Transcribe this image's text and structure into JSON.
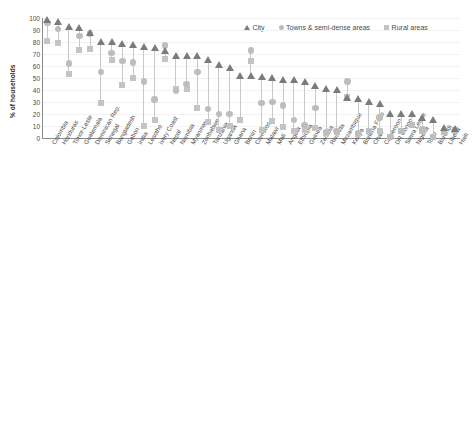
{
  "chart_data": [
    {
      "id": "top",
      "type": "scatter",
      "title": "",
      "xlabel": "",
      "ylabel": "% of households",
      "ylim": [
        0,
        100
      ],
      "yticks": [
        0,
        10,
        20,
        30,
        40,
        50,
        60,
        70,
        80,
        90,
        100
      ],
      "grid": true,
      "legend_position": "top-right",
      "legend": [
        "City",
        "Towns & semi-dense areas",
        "Rural areas"
      ],
      "categories": [
        "Colombia",
        "Honduras",
        "Timor-Leste",
        "Guatemala",
        "Dominican Rep.",
        "Senegal",
        "Bangladesh",
        "Gabon",
        "India",
        "Lesotho",
        "Ivory Coast",
        "Nepal",
        "Namibia",
        "Myanmar",
        "Zimbabwe",
        "Tanzania",
        "Uganda",
        "Ghana",
        "Benin",
        "Comoros",
        "Malawi",
        "Mali",
        "Angola",
        "Ethiopia",
        "Guinea",
        "Zambia",
        "Rwanda",
        "Mozambique",
        "Kenya",
        "Burkina Faso",
        "Chad",
        "Cameroon",
        "DR Congo",
        "Sierra Leone",
        "Nigeria",
        "Togo",
        "Burundi",
        "Liberia",
        "Haiti"
      ],
      "series": [
        {
          "name": "City",
          "marker": "triangle",
          "color": "#7b7b7b",
          "values": [
            99,
            97,
            93,
            92,
            88,
            80,
            80,
            79,
            78,
            76,
            75,
            73,
            69,
            69,
            69,
            65,
            61,
            59,
            52,
            52,
            51,
            50,
            49,
            49,
            47,
            44,
            41,
            40,
            34,
            33,
            30,
            29,
            20,
            20,
            20,
            17,
            15,
            9,
            8
          ]
        },
        {
          "name": "Towns & semi-dense areas",
          "marker": "circle",
          "color": "#bdbdbd",
          "values": [
            96,
            91,
            62,
            85,
            87,
            55,
            71,
            64,
            63,
            47,
            32,
            77,
            39,
            45,
            55,
            24,
            20,
            20,
            null,
            73,
            29,
            30,
            27,
            15,
            11,
            25,
            5,
            6,
            47,
            4,
            5,
            17,
            1,
            6,
            11,
            7,
            1,
            5,
            6
          ]
        },
        {
          "name": "Rural areas",
          "marker": "square",
          "color": "#c4c4c4",
          "values": [
            81,
            79,
            53,
            73,
            74,
            29,
            65,
            44,
            50,
            10,
            15,
            66,
            41,
            41,
            25,
            13,
            7,
            10,
            15,
            64,
            7,
            14,
            9,
            6,
            7,
            8,
            4,
            5,
            34,
            3,
            6,
            6,
            1,
            6,
            11,
            6,
            1,
            5,
            7
          ]
        }
      ]
    },
    {
      "id": "bottom",
      "type": "scatter",
      "title": "",
      "xlabel": "",
      "ylabel": "% of households",
      "ylim": [
        0,
        100
      ],
      "yticks": [
        0,
        10,
        20,
        30,
        40,
        50,
        60,
        70,
        80,
        90,
        100
      ],
      "grid": true,
      "legend_position": "top-right",
      "legend": [
        "Cities",
        "Towns & semi-dense areas",
        "Rural areas"
      ],
      "categories": [
        "Colombia",
        "Dominican Rep.",
        "Gabon",
        "Nepal",
        "Timor-Leste",
        "Guatemala",
        "Cambodia",
        "India",
        "Ghana",
        "Ivory Coast",
        "Cameroon",
        "Myanmar",
        "Nigeria",
        "Comoros",
        "Senegal",
        "Zimbabwe",
        "Bangladesh",
        "Togo",
        "Benin",
        "Uganda",
        "Namibia",
        "Guinea",
        "Rwanda",
        "Haiti",
        "Mali",
        "Angola",
        "Tanzania",
        "Lesotho",
        "Zambia",
        "Mozambique",
        "Ethiopia",
        "Sierra Leone",
        "Malawi",
        "Burkina Faso",
        "DR Congo",
        "Kenya",
        "Chad",
        "Liberia",
        "Burundi"
      ],
      "series": [
        {
          "name": "Cities",
          "marker": "triangle",
          "color": "#7b7b7b",
          "values": [
            99,
            99,
            98,
            98,
            99,
            97,
            96,
            95,
            92,
            90,
            87,
            86,
            85,
            85,
            85,
            81,
            79,
            76,
            75,
            72,
            72,
            71,
            70,
            68,
            68,
            65,
            62,
            62,
            61,
            58,
            57,
            51,
            49,
            47,
            44,
            33,
            32,
            19,
            17
          ]
        },
        {
          "name": "Towns & semi-dense areas",
          "marker": "circle",
          "color": "#bdbdbd",
          "values": [
            96,
            96,
            96,
            87,
            91,
            null,
            64,
            87,
            78,
            55,
            56,
            59,
            57,
            76,
            52,
            54,
            46,
            35,
            28,
            72,
            72,
            12,
            14,
            22,
            null,
            32,
            20,
            45,
            28,
            18,
            28,
            2,
            21,
            10,
            1,
            52,
            null,
            4,
            1
          ]
        },
        {
          "name": "Rural areas",
          "marker": "square",
          "color": "#c4c4c4",
          "values": [
            95,
            93,
            75,
            88,
            66,
            82,
            48,
            82,
            61,
            30,
            27,
            41,
            31,
            64,
            23,
            16,
            36,
            15,
            12,
            18,
            28,
            4,
            13,
            13,
            10,
            12,
            6,
            16,
            7,
            5,
            10,
            1,
            3,
            2,
            1,
            31,
            1,
            2,
            1
          ]
        }
      ]
    }
  ]
}
